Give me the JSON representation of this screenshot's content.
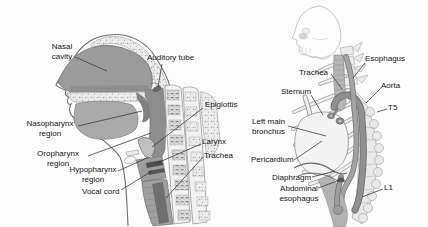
{
  "left_panel": {
    "labels": {
      "nasal_cavity": "Nasal\ncavity",
      "auditory_tube": "Auditory tube",
      "epiglottis": "Epiglottis",
      "nasopharynx": "Nasopharynx\nregion",
      "oropharynx": "Oropharynx\nregion",
      "hypopharynx": "Hypopharynx\nregion",
      "vocal_cord": "Vocal cord",
      "larynx": "Larynx",
      "trachea": "Trachea"
    }
  },
  "right_panel": {
    "labels": {
      "trachea": "Trachea",
      "esophagus": "Esophagus",
      "sternum": "Sternum",
      "aorta": "Aorta",
      "t5": "T5",
      "left_main_bronchus": "Left main\nbronchus",
      "pericardium": "Pericardium",
      "diaphragm": "Diaphragm",
      "abdominal_esophagus": "Abdominal\nesophagus",
      "l1": "L1"
    }
  },
  "colors": {
    "background": "#fcfcfc",
    "label_text": "#141414",
    "leader_line": "#3c3c3c",
    "cavity_gray": "#9b9b9b",
    "pharynx_gray": "#8d8d8d",
    "bone_light": "#ececec",
    "skull_outline_light": "#c5c5c5",
    "vocal_cord_dark": "#4d4d4d"
  }
}
